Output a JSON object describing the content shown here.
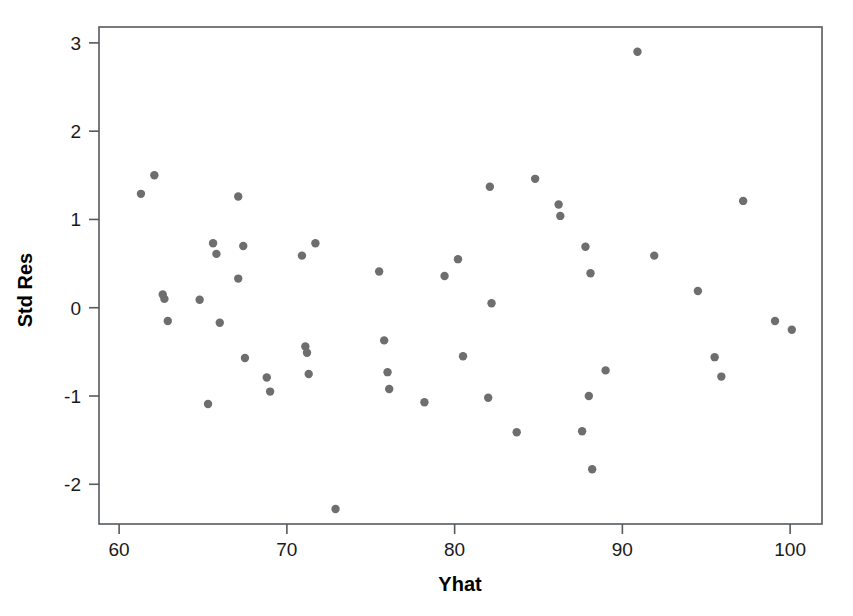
{
  "chart_data": {
    "type": "scatter",
    "title": "",
    "xlabel": "Yhat",
    "ylabel": "Std Res",
    "xlim": [
      58.8,
      101.9
    ],
    "ylim": [
      -2.45,
      3.18
    ],
    "xticks": [
      60,
      70,
      80,
      90,
      100
    ],
    "xtick_labels": [
      "60",
      "70",
      "80",
      "90",
      "100"
    ],
    "yticks": [
      -2,
      -1,
      0,
      1,
      2,
      3
    ],
    "ytick_labels": [
      "-2",
      "-1",
      "0",
      "1",
      "2",
      "3"
    ],
    "grid": false,
    "legend": null,
    "point_color": "#6e6e70",
    "point_radius": 4.2,
    "n_points": 54,
    "points": [
      {
        "x": 61.3,
        "y": 1.29
      },
      {
        "x": 62.1,
        "y": 1.5
      },
      {
        "x": 62.6,
        "y": 0.15
      },
      {
        "x": 62.7,
        "y": 0.1
      },
      {
        "x": 62.9,
        "y": -0.15
      },
      {
        "x": 64.8,
        "y": 0.09
      },
      {
        "x": 65.3,
        "y": -1.09
      },
      {
        "x": 65.6,
        "y": 0.73
      },
      {
        "x": 65.8,
        "y": 0.61
      },
      {
        "x": 66.0,
        "y": -0.17
      },
      {
        "x": 67.1,
        "y": 1.26
      },
      {
        "x": 67.1,
        "y": 0.33
      },
      {
        "x": 67.4,
        "y": 0.7
      },
      {
        "x": 67.5,
        "y": -0.57
      },
      {
        "x": 68.8,
        "y": -0.79
      },
      {
        "x": 69.0,
        "y": -0.95
      },
      {
        "x": 70.9,
        "y": 0.59
      },
      {
        "x": 71.1,
        "y": -0.44
      },
      {
        "x": 71.2,
        "y": -0.51
      },
      {
        "x": 71.3,
        "y": -0.75
      },
      {
        "x": 71.7,
        "y": 0.73
      },
      {
        "x": 72.9,
        "y": -2.28
      },
      {
        "x": 75.5,
        "y": 0.41
      },
      {
        "x": 75.8,
        "y": -0.37
      },
      {
        "x": 76.0,
        "y": -0.73
      },
      {
        "x": 76.1,
        "y": -0.92
      },
      {
        "x": 78.2,
        "y": -1.07
      },
      {
        "x": 79.4,
        "y": 0.36
      },
      {
        "x": 80.2,
        "y": 0.55
      },
      {
        "x": 80.5,
        "y": -0.55
      },
      {
        "x": 82.0,
        "y": -1.02
      },
      {
        "x": 82.1,
        "y": 1.37
      },
      {
        "x": 82.2,
        "y": 0.05
      },
      {
        "x": 83.7,
        "y": -1.41
      },
      {
        "x": 84.8,
        "y": 1.46
      },
      {
        "x": 86.2,
        "y": 1.17
      },
      {
        "x": 86.3,
        "y": 1.04
      },
      {
        "x": 87.6,
        "y": -1.4
      },
      {
        "x": 87.8,
        "y": 0.69
      },
      {
        "x": 88.0,
        "y": -1.0
      },
      {
        "x": 88.1,
        "y": 0.39
      },
      {
        "x": 88.2,
        "y": -1.83
      },
      {
        "x": 89.0,
        "y": -0.71
      },
      {
        "x": 90.9,
        "y": 2.9
      },
      {
        "x": 91.9,
        "y": 0.59
      },
      {
        "x": 94.5,
        "y": 0.19
      },
      {
        "x": 95.5,
        "y": -0.56
      },
      {
        "x": 95.9,
        "y": -0.78
      },
      {
        "x": 97.2,
        "y": 1.21
      },
      {
        "x": 99.1,
        "y": -0.15
      },
      {
        "x": 100.1,
        "y": -0.25
      }
    ]
  },
  "axes": {
    "x_axis_name": "Yhat",
    "y_axis_name": "Std Res"
  }
}
